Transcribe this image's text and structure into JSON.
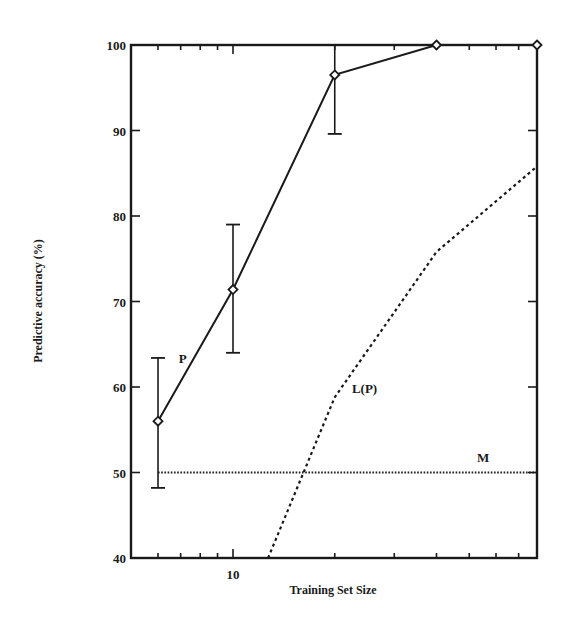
{
  "chart_data": {
    "type": "line",
    "title": "",
    "xlabel": "Training Set Size",
    "ylabel": "Predictive accuracy (%)",
    "xscale": "log",
    "xlim": [
      6,
      80
    ],
    "ylim": [
      40,
      100
    ],
    "grid": false,
    "legend": "inline labels",
    "x_tick_labels": [
      {
        "value": 10,
        "label": "10"
      }
    ],
    "x_minor_ticks": [
      6,
      7,
      8,
      9,
      20,
      30,
      40,
      50,
      60,
      70
    ],
    "y_ticks": [
      40,
      50,
      60,
      70,
      80,
      90,
      100
    ],
    "y_tick_labels": [
      "40",
      "50",
      "60",
      "70",
      "80",
      "90",
      "100"
    ],
    "series": [
      {
        "name": "P",
        "style": "solid",
        "marker": "diamond",
        "x": [
          6,
          10,
          20,
          40,
          80
        ],
        "y": [
          56,
          71.4,
          96.5,
          100,
          100
        ],
        "error_low": [
          48.2,
          64,
          89.6,
          null,
          null
        ],
        "error_high": [
          63.4,
          79,
          100,
          null,
          null
        ],
        "label_pos": {
          "x": 7.1,
          "y": 62.8
        }
      },
      {
        "name": "L(P)",
        "style": "dashed",
        "marker": "none",
        "x": [
          12.7,
          20,
          40,
          80
        ],
        "y": [
          40,
          58.8,
          75.8,
          85.8
        ],
        "label_pos": {
          "x": 24.5,
          "y": 59.3
        }
      },
      {
        "name": "M",
        "style": "dotted",
        "marker": "none",
        "x": [
          6,
          80
        ],
        "y": [
          50,
          50
        ],
        "label_pos": {
          "x": 55,
          "y": 51.2
        }
      }
    ]
  }
}
